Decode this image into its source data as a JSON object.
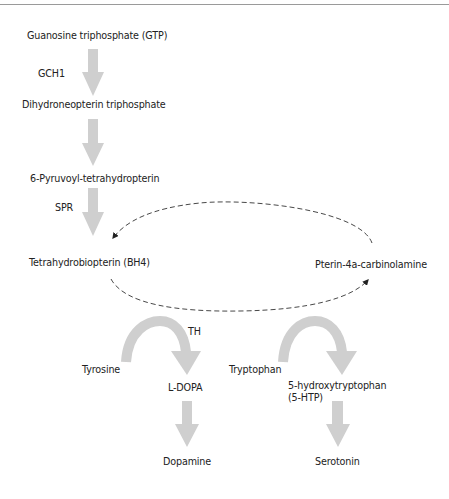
{
  "diagram": {
    "colors": {
      "arrow_fill": "#cfcfcf",
      "dashed_line": "#333333",
      "text": "#222222",
      "top_rule": "#9a9a9a"
    },
    "nodes": {
      "gtp": "Guanosine triphosphate (GTP)",
      "dihydroneopterin": "Dihydroneopterin triphosphate",
      "pyruvoyl": "6-Pyruvoyl-tetrahydropterin",
      "bh4": "Tetrahydrobiopterin (BH4)",
      "pterin_carbinolamine": "Pterin-4a-carbinolamine",
      "tyrosine": "Tyrosine",
      "ldopa": "L-DOPA",
      "tryptophan": "Tryptophan",
      "five_htp_line1": "5-hydroxytryptophan",
      "five_htp_line2": "(5-HTP)",
      "dopamine": "Dopamine",
      "serotonin": "Serotonin"
    },
    "enzymes": {
      "gch1": "GCH1",
      "spr": "SPR",
      "th": "TH"
    },
    "edges": [
      {
        "from": "Guanosine triphosphate (GTP)",
        "to": "Dihydroneopterin triphosphate",
        "label": "GCH1",
        "style": "block-arrow"
      },
      {
        "from": "Dihydroneopterin triphosphate",
        "to": "6-Pyruvoyl-tetrahydropterin",
        "label": "",
        "style": "block-arrow"
      },
      {
        "from": "6-Pyruvoyl-tetrahydropterin",
        "to": "Tetrahydrobiopterin (BH4)",
        "label": "SPR",
        "style": "block-arrow"
      },
      {
        "from": "Tetrahydrobiopterin (BH4)",
        "to": "Pterin-4a-carbinolamine",
        "label": "",
        "style": "dashed-curve"
      },
      {
        "from": "Pterin-4a-carbinolamine",
        "to": "Tetrahydrobiopterin (BH4)",
        "label": "",
        "style": "dashed-curve"
      },
      {
        "from": "Tyrosine",
        "to": "L-DOPA",
        "label": "TH",
        "style": "curved-block-arrow"
      },
      {
        "from": "Tryptophan",
        "to": "5-hydroxytryptophan (5-HTP)",
        "label": "",
        "style": "curved-block-arrow"
      },
      {
        "from": "L-DOPA",
        "to": "Dopamine",
        "label": "",
        "style": "block-arrow"
      },
      {
        "from": "5-hydroxytryptophan (5-HTP)",
        "to": "Serotonin",
        "label": "",
        "style": "block-arrow"
      }
    ]
  }
}
